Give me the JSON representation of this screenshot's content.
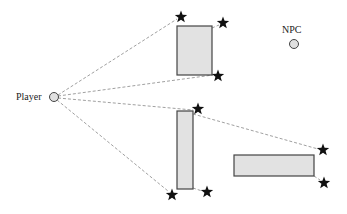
{
  "diagram": {
    "title": "",
    "player": {
      "label": "Player",
      "x": 54,
      "y": 97,
      "r": 4.5
    },
    "npc": {
      "label": "NPC",
      "x": 294,
      "y": 44,
      "r": 4.5
    },
    "obstacles": [
      {
        "id": "obstacle-1",
        "x": 177,
        "y": 26,
        "w": 35,
        "h": 49
      },
      {
        "id": "obstacle-2",
        "x": 177,
        "y": 111,
        "w": 16,
        "h": 78
      },
      {
        "id": "obstacle-3",
        "x": 234,
        "y": 155,
        "w": 80,
        "h": 21
      }
    ],
    "stars": [
      {
        "x": 181,
        "y": 17
      },
      {
        "x": 223,
        "y": 23
      },
      {
        "x": 218,
        "y": 76
      },
      {
        "x": 198,
        "y": 109
      },
      {
        "x": 172,
        "y": 195
      },
      {
        "x": 207,
        "y": 192
      },
      {
        "x": 323,
        "y": 150
      },
      {
        "x": 324,
        "y": 183
      }
    ],
    "sight_lines": [
      {
        "x1": 58,
        "y1": 95,
        "x2": 177,
        "y2": 19
      },
      {
        "x1": 58,
        "y1": 96,
        "x2": 213,
        "y2": 75
      },
      {
        "x1": 58,
        "y1": 98,
        "x2": 193,
        "y2": 110
      },
      {
        "x1": 57,
        "y1": 100,
        "x2": 168,
        "y2": 191
      },
      {
        "x1": 212,
        "y1": 28,
        "x2": 219,
        "y2": 25
      },
      {
        "x1": 193,
        "y1": 114,
        "x2": 318,
        "y2": 149
      },
      {
        "x1": 193,
        "y1": 188,
        "x2": 202,
        "y2": 191
      },
      {
        "x1": 314,
        "y1": 176,
        "x2": 320,
        "y2": 180
      }
    ],
    "colors": {
      "obstacle_fill": "#e2e2e2",
      "obstacle_stroke": "#444444",
      "line": "#888888",
      "star": "#111111",
      "circle_fill": "#e0e0e0",
      "circle_stroke": "#444444"
    }
  }
}
